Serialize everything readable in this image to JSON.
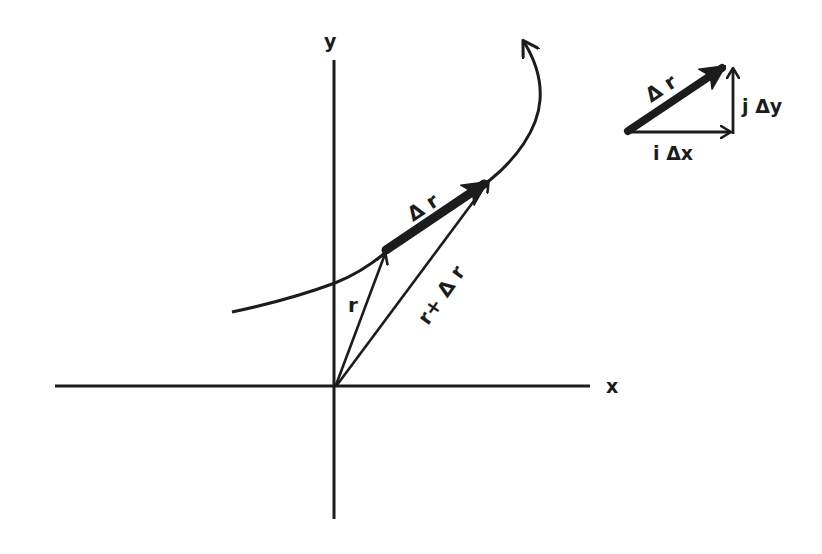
{
  "figure": {
    "type": "vector-displacement-diagram",
    "colors": {
      "ink": "#1c1c1c",
      "background": "#ffffff"
    }
  },
  "axes": {
    "x_label": "x",
    "y_label": "y"
  },
  "main_vectors": {
    "position_label": "r",
    "displacement_label": "Δ r",
    "new_position_label": "r+ Δ r"
  },
  "inset": {
    "displacement_label": "Δ r",
    "x_component_label": "i Δx",
    "y_component_label": "j Δy"
  }
}
